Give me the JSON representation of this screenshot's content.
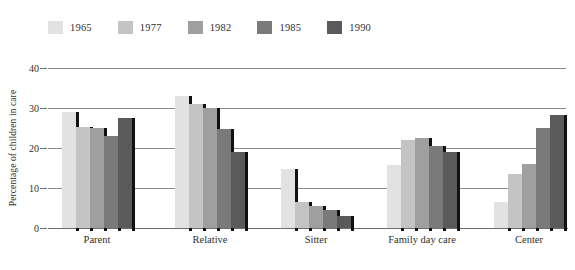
{
  "chart_data": {
    "type": "bar",
    "title": "",
    "subtitle": "",
    "xlabel": "",
    "ylabel": "Percentage of children in care",
    "ylim": [
      0,
      40
    ],
    "yticks": [
      0,
      10,
      20,
      30,
      40
    ],
    "ytick_labels": [
      "0",
      "10",
      "20",
      "30",
      "40"
    ],
    "grid": true,
    "grid_axis": "y",
    "legend_position": "top-left",
    "categories": [
      "Parent",
      "Relative",
      "Sitter",
      "Family day care",
      "Center"
    ],
    "series": [
      {
        "name": "1965",
        "color": "#e2e2e2",
        "values": [
          29.0,
          33.0,
          14.8,
          15.8,
          6.5
        ]
      },
      {
        "name": "1977",
        "color": "#c4c4c4",
        "values": [
          25.2,
          31.0,
          6.5,
          22.0,
          13.5
        ]
      },
      {
        "name": "1982",
        "color": "#9f9f9f",
        "values": [
          25.0,
          30.0,
          5.5,
          22.5,
          16.0
        ]
      },
      {
        "name": "1985",
        "color": "#7a7a7a",
        "values": [
          23.0,
          24.8,
          4.5,
          20.5,
          25.0
        ]
      },
      {
        "name": "1990",
        "color": "#5a5a5a",
        "values": [
          27.5,
          19.0,
          3.0,
          19.0,
          28.2
        ]
      }
    ]
  },
  "legend": {
    "items": [
      {
        "label": "1965"
      },
      {
        "label": "1977"
      },
      {
        "label": "1982"
      },
      {
        "label": "1985"
      },
      {
        "label": "1990"
      }
    ]
  },
  "axes": {
    "y_title": "Percentage of children in care"
  }
}
